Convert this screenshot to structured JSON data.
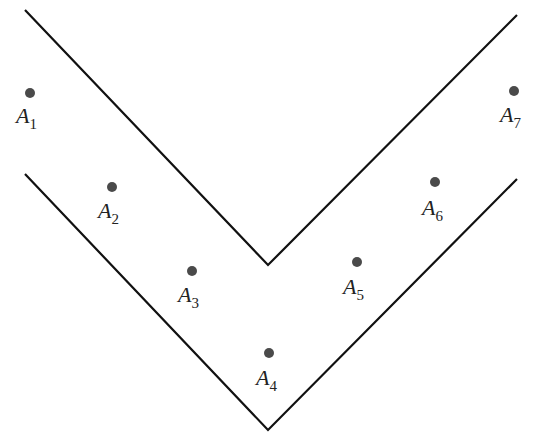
{
  "diagram": {
    "line_color": "#111111",
    "point_color": "#4a4a4a",
    "outer_v": [
      [
        25,
        10
      ],
      [
        268,
        265
      ],
      [
        517,
        15
      ]
    ],
    "inner_v": [
      [
        25,
        174
      ],
      [
        268,
        430
      ],
      [
        517,
        179
      ]
    ],
    "points": [
      {
        "letter": "A",
        "sub": "1",
        "x": 30,
        "y": 93,
        "lx": 16,
        "ly": 123
      },
      {
        "letter": "A",
        "sub": "2",
        "x": 112,
        "y": 187,
        "lx": 98,
        "ly": 218
      },
      {
        "letter": "A",
        "sub": "3",
        "x": 192,
        "y": 271,
        "lx": 178,
        "ly": 302
      },
      {
        "letter": "A",
        "sub": "4",
        "x": 269,
        "y": 353,
        "lx": 256,
        "ly": 385
      },
      {
        "letter": "A",
        "sub": "5",
        "x": 357,
        "y": 262,
        "lx": 343,
        "ly": 294
      },
      {
        "letter": "A",
        "sub": "6",
        "x": 435,
        "y": 182,
        "lx": 422,
        "ly": 215
      },
      {
        "letter": "A",
        "sub": "7",
        "x": 514,
        "y": 91,
        "lx": 500,
        "ly": 122
      }
    ]
  }
}
